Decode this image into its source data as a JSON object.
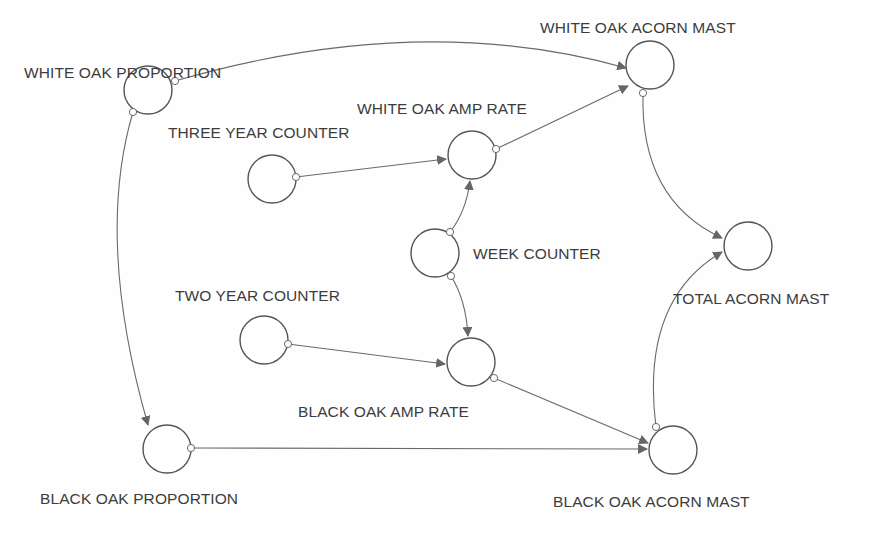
{
  "diagram": {
    "type": "stella-influence-diagram",
    "colors": {
      "stroke": "#555555",
      "text": "#3c3c3c",
      "arrow": "#666666",
      "background": "#fefefe"
    },
    "nodes": [
      {
        "id": "white_oak_proportion",
        "label": "WHITE OAK PROPORTION",
        "cx": 148,
        "cy": 90,
        "r": 24,
        "lx": 24,
        "ly": 64
      },
      {
        "id": "white_oak_acorn_mast",
        "label": "WHITE OAK ACORN MAST",
        "cx": 650,
        "cy": 65,
        "r": 24,
        "lx": 540,
        "ly": 19
      },
      {
        "id": "three_year_counter",
        "label": "THREE YEAR COUNTER",
        "cx": 272,
        "cy": 179,
        "r": 24,
        "lx": 168,
        "ly": 124
      },
      {
        "id": "white_oak_amp_rate",
        "label": "WHITE OAK AMP RATE",
        "cx": 472,
        "cy": 155,
        "r": 24,
        "lx": 357,
        "ly": 100
      },
      {
        "id": "week_counter",
        "label": "WEEK COUNTER",
        "cx": 435,
        "cy": 253,
        "r": 24,
        "lx": 473,
        "ly": 245
      },
      {
        "id": "total_acorn_mast",
        "label": "TOTAL ACORN MAST",
        "cx": 748,
        "cy": 246,
        "r": 24,
        "lx": 673,
        "ly": 290
      },
      {
        "id": "two_year_counter",
        "label": "TWO YEAR COUNTER",
        "cx": 264,
        "cy": 340,
        "r": 24,
        "lx": 175,
        "ly": 287
      },
      {
        "id": "black_oak_amp_rate",
        "label": "BLACK OAK AMP RATE",
        "cx": 471,
        "cy": 362,
        "r": 24,
        "lx": 298,
        "ly": 403
      },
      {
        "id": "black_oak_proportion",
        "label": "BLACK OAK PROPORTION",
        "cx": 167,
        "cy": 449,
        "r": 24,
        "lx": 40,
        "ly": 490
      },
      {
        "id": "black_oak_acorn_mast",
        "label": "BLACK OAK ACORN MAST",
        "cx": 673,
        "cy": 450,
        "r": 24,
        "lx": 553,
        "ly": 493
      }
    ],
    "connectors": [
      {
        "from": "white_oak_proportion",
        "to": "white_oak_acorn_mast",
        "path": "M175,81 Q420,10 626,68",
        "ox": 175,
        "oy": 81
      },
      {
        "from": "white_oak_proportion",
        "to": "black_oak_proportion",
        "path": "M133,112 Q95,240 148,425",
        "ox": 133,
        "oy": 112
      },
      {
        "from": "three_year_counter",
        "to": "white_oak_amp_rate",
        "path": "M296,177 L446,159",
        "ox": 296,
        "oy": 177
      },
      {
        "from": "white_oak_amp_rate",
        "to": "white_oak_acorn_mast",
        "path": "M496,149 L628,86",
        "ox": 496,
        "oy": 149
      },
      {
        "from": "week_counter",
        "to": "white_oak_amp_rate",
        "path": "M450,232 Q466,212 470,181",
        "ox": 450,
        "oy": 232
      },
      {
        "from": "week_counter",
        "to": "black_oak_amp_rate",
        "path": "M451,276 Q466,300 468,336",
        "ox": 451,
        "oy": 276
      },
      {
        "from": "two_year_counter",
        "to": "black_oak_amp_rate",
        "path": "M288,344 L445,364",
        "ox": 288,
        "oy": 344
      },
      {
        "from": "black_oak_amp_rate",
        "to": "black_oak_acorn_mast",
        "path": "M494,378 L648,443",
        "ox": 494,
        "oy": 378
      },
      {
        "from": "black_oak_proportion",
        "to": "black_oak_acorn_mast",
        "path": "M191,448 L647,449",
        "ox": 191,
        "oy": 448
      },
      {
        "from": "white_oak_acorn_mast",
        "to": "total_acorn_mast",
        "path": "M643,93 Q640,200 722,238",
        "ox": 643,
        "oy": 93
      },
      {
        "from": "black_oak_acorn_mast",
        "to": "total_acorn_mast",
        "path": "M656,427 Q640,300 722,252",
        "ox": 656,
        "oy": 427
      }
    ]
  }
}
